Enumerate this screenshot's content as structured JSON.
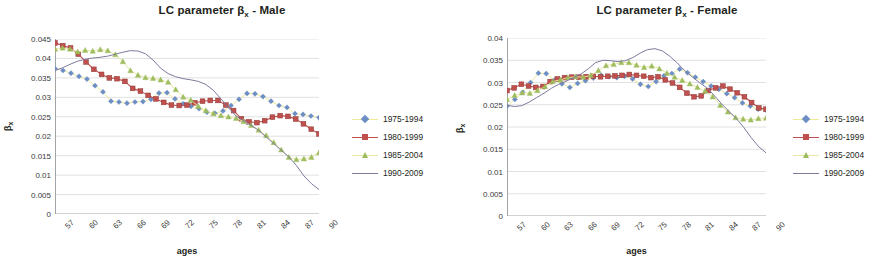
{
  "figure": {
    "panels": [
      {
        "id": "male",
        "title_prefix": "LC parameter ",
        "title_symbol": "β",
        "title_sub": "x",
        "title_suffix": " - Male",
        "title_full": "LC parameter βx - Male"
      },
      {
        "id": "female",
        "title_prefix": "LC parameter ",
        "title_symbol": "β",
        "title_sub": "x",
        "title_suffix": " - Female",
        "title_full": "LC parameter βx - Female"
      }
    ],
    "axis_y_symbol": "β",
    "axis_y_sub": "x",
    "axis_x_title": "ages"
  },
  "colors": {
    "series_1975_1994_line": "#eeea9a",
    "series_1975_1994_marker": "#6c8ec4",
    "series_1980_1999_line": "#c0504d",
    "series_1980_1999_marker": "#c0504d",
    "series_1985_2004_line": "#e8e8a0",
    "series_1985_2004_marker": "#9bbb59",
    "series_1990_2009_line": "#7d7a9e",
    "gridline": "#d4d4d4",
    "axis": "#9a9a9a",
    "text": "#231f20"
  },
  "legend": {
    "entries": [
      {
        "label": "1975-1994",
        "marker": "diamond"
      },
      {
        "label": "1980-1999",
        "marker": "square"
      },
      {
        "label": "1985-2004",
        "marker": "triangle"
      },
      {
        "label": "1990-2009",
        "marker": "none"
      }
    ]
  },
  "chart_data": [
    {
      "type": "line",
      "panel": "male",
      "title": "LC parameter βx - Male",
      "xlabel": "ages",
      "ylabel": "βx",
      "grid": true,
      "legend_position": "right",
      "xlim": [
        57,
        90
      ],
      "ylim": [
        0,
        0.045
      ],
      "ytick_labels": [
        "0.045",
        "0.04",
        "0.035",
        "0.03",
        "0.025",
        "0.02",
        "0.015",
        "0.01",
        "0.005",
        "0"
      ],
      "ytick_values": [
        0.045,
        0.04,
        0.035,
        0.03,
        0.025,
        0.02,
        0.015,
        0.01,
        0.005,
        0
      ],
      "xtick_labels": [
        "57",
        "60",
        "63",
        "66",
        "69",
        "72",
        "75",
        "78",
        "81",
        "84",
        "87",
        "90"
      ],
      "xtick_values": [
        57,
        60,
        63,
        66,
        69,
        72,
        75,
        78,
        81,
        84,
        87,
        90
      ],
      "x": [
        57,
        58,
        59,
        60,
        61,
        62,
        63,
        64,
        65,
        66,
        67,
        68,
        69,
        70,
        71,
        72,
        73,
        74,
        75,
        76,
        77,
        78,
        79,
        80,
        81,
        82,
        83,
        84,
        85,
        86,
        87,
        88,
        89,
        90
      ],
      "series": [
        {
          "name": "1975-1994",
          "marker": "diamond",
          "values": [
            0.0374,
            0.0369,
            0.0362,
            0.0354,
            0.0347,
            0.033,
            0.0314,
            0.029,
            0.0288,
            0.0285,
            0.0288,
            0.0289,
            0.0295,
            0.0311,
            0.0312,
            0.0296,
            0.0283,
            0.0277,
            0.0271,
            0.0262,
            0.0259,
            0.0265,
            0.0279,
            0.0295,
            0.031,
            0.0309,
            0.0302,
            0.029,
            0.0279,
            0.0274,
            0.0258,
            0.0256,
            0.0252,
            0.0248
          ]
        },
        {
          "name": "1980-1999",
          "marker": "square",
          "values": [
            0.044,
            0.0433,
            0.0427,
            0.0411,
            0.0391,
            0.0372,
            0.0359,
            0.035,
            0.0348,
            0.0341,
            0.0323,
            0.0316,
            0.0305,
            0.0296,
            0.0287,
            0.028,
            0.0279,
            0.028,
            0.0286,
            0.029,
            0.0292,
            0.0292,
            0.028,
            0.0266,
            0.0245,
            0.0237,
            0.0235,
            0.024,
            0.0249,
            0.0253,
            0.0251,
            0.0244,
            0.0232,
            0.0218,
            0.0206
          ]
        },
        {
          "name": "1985-2004",
          "marker": "triangle",
          "values": [
            0.0424,
            0.0427,
            0.0424,
            0.0417,
            0.0421,
            0.0419,
            0.0423,
            0.042,
            0.041,
            0.0392,
            0.0369,
            0.0357,
            0.0351,
            0.0349,
            0.0345,
            0.0339,
            0.032,
            0.0301,
            0.0293,
            0.0277,
            0.0266,
            0.0258,
            0.0253,
            0.025,
            0.0246,
            0.0238,
            0.0228,
            0.0216,
            0.0202,
            0.0184,
            0.0165,
            0.0146,
            0.014,
            0.0142,
            0.0146,
            0.0158
          ]
        },
        {
          "name": "1990-2009",
          "marker": "none",
          "values": [
            0.0369,
            0.0376,
            0.0385,
            0.0393,
            0.0398,
            0.0401,
            0.0403,
            0.0406,
            0.0411,
            0.0416,
            0.042,
            0.0419,
            0.0412,
            0.0396,
            0.0375,
            0.0361,
            0.0353,
            0.0348,
            0.0345,
            0.0341,
            0.0333,
            0.0318,
            0.0296,
            0.0273,
            0.0252,
            0.024,
            0.0228,
            0.0215,
            0.0198,
            0.0181,
            0.0164,
            0.0147,
            0.0125,
            0.0098,
            0.0078,
            0.0063
          ]
        }
      ]
    },
    {
      "type": "line",
      "panel": "female",
      "title": "LC parameter βx - Female",
      "xlabel": "ages",
      "ylabel": "βx",
      "grid": true,
      "legend_position": "right",
      "xlim": [
        57,
        90
      ],
      "ylim": [
        0,
        0.04
      ],
      "ytick_labels": [
        "0.04",
        "0.035",
        "0.03",
        "0.025",
        "0.02",
        "0.015",
        "0.01",
        "0.005",
        "0"
      ],
      "ytick_values": [
        0.04,
        0.035,
        0.03,
        0.025,
        0.02,
        0.015,
        0.01,
        0.005,
        0
      ],
      "xtick_labels": [
        "57",
        "60",
        "63",
        "66",
        "69",
        "72",
        "75",
        "78",
        "81",
        "84",
        "87",
        "90"
      ],
      "xtick_values": [
        57,
        60,
        63,
        66,
        69,
        72,
        75,
        78,
        81,
        84,
        87,
        90
      ],
      "x": [
        57,
        58,
        59,
        60,
        61,
        62,
        63,
        64,
        65,
        66,
        67,
        68,
        69,
        70,
        71,
        72,
        73,
        74,
        75,
        76,
        77,
        78,
        79,
        80,
        81,
        82,
        83,
        84,
        85,
        86,
        87,
        88,
        89,
        90
      ],
      "series": [
        {
          "name": "1975-1994",
          "marker": "diamond",
          "values": [
            0.0247,
            0.0262,
            0.0278,
            0.03,
            0.0321,
            0.032,
            0.0305,
            0.0297,
            0.0289,
            0.0298,
            0.0304,
            0.031,
            0.0316,
            0.0313,
            0.0311,
            0.0314,
            0.0308,
            0.0296,
            0.0291,
            0.0302,
            0.0315,
            0.032,
            0.033,
            0.0322,
            0.0312,
            0.0302,
            0.0292,
            0.0285,
            0.0275,
            0.0266,
            0.0254,
            0.0247,
            0.024,
            0.0238
          ]
        },
        {
          "name": "1980-1999",
          "marker": "square",
          "values": [
            0.0282,
            0.0288,
            0.0296,
            0.0292,
            0.0289,
            0.0291,
            0.0302,
            0.0308,
            0.0311,
            0.0312,
            0.0312,
            0.0313,
            0.0314,
            0.0313,
            0.0314,
            0.0315,
            0.0316,
            0.0318,
            0.0316,
            0.0314,
            0.0311,
            0.0313,
            0.0306,
            0.0299,
            0.0289,
            0.0276,
            0.0268,
            0.027,
            0.0282,
            0.0288,
            0.0292,
            0.0285,
            0.0277,
            0.0268,
            0.0255,
            0.0243,
            0.024
          ]
        },
        {
          "name": "1985-2004",
          "marker": "triangle",
          "values": [
            0.0262,
            0.0271,
            0.0277,
            0.0276,
            0.0282,
            0.0291,
            0.0302,
            0.0306,
            0.0311,
            0.0313,
            0.0312,
            0.0316,
            0.0327,
            0.0338,
            0.0341,
            0.0345,
            0.0345,
            0.0339,
            0.0334,
            0.0337,
            0.0331,
            0.0321,
            0.0312,
            0.0305,
            0.0297,
            0.0289,
            0.0281,
            0.0268,
            0.0249,
            0.0234,
            0.0221,
            0.0218,
            0.0216,
            0.0219,
            0.022
          ]
        },
        {
          "name": "1990-2009",
          "marker": "none",
          "values": [
            0.0249,
            0.0246,
            0.0248,
            0.0256,
            0.0266,
            0.0276,
            0.0287,
            0.0296,
            0.0303,
            0.0311,
            0.0319,
            0.0331,
            0.0345,
            0.035,
            0.0349,
            0.0347,
            0.0349,
            0.0356,
            0.0366,
            0.0374,
            0.0376,
            0.0371,
            0.0359,
            0.0344,
            0.0327,
            0.0313,
            0.03,
            0.0288,
            0.0271,
            0.0252,
            0.0235,
            0.0219,
            0.0199,
            0.0176,
            0.0156,
            0.0142
          ]
        }
      ]
    }
  ]
}
